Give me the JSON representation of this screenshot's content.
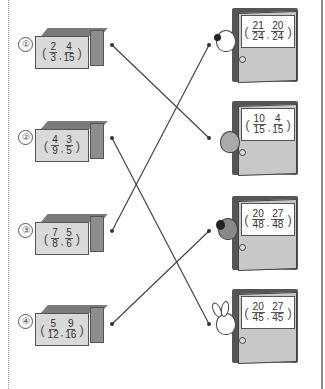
{
  "worksheet": {
    "boxes": [
      {
        "number": "①",
        "fractions": [
          {
            "n": "2",
            "d": "3"
          },
          {
            "n": "4",
            "d": "15"
          }
        ]
      },
      {
        "number": "②",
        "fractions": [
          {
            "n": "4",
            "d": "9"
          },
          {
            "n": "3",
            "d": "5"
          }
        ]
      },
      {
        "number": "③",
        "fractions": [
          {
            "n": "7",
            "d": "8"
          },
          {
            "n": "5",
            "d": "6"
          }
        ]
      },
      {
        "number": "④",
        "fractions": [
          {
            "n": "5",
            "d": "12"
          },
          {
            "n": "9",
            "d": "16"
          }
        ]
      }
    ],
    "doors": [
      {
        "animal": "dog",
        "fractions": [
          {
            "n": "21",
            "d": "24"
          },
          {
            "n": "20",
            "d": "24"
          }
        ]
      },
      {
        "animal": "cat",
        "fractions": [
          {
            "n": "10",
            "d": "15"
          },
          {
            "n": "4",
            "d": "15"
          }
        ]
      },
      {
        "animal": "black-dog",
        "fractions": [
          {
            "n": "20",
            "d": "48"
          },
          {
            "n": "27",
            "d": "48"
          }
        ]
      },
      {
        "animal": "rabbit",
        "fractions": [
          {
            "n": "20",
            "d": "45"
          },
          {
            "n": "27",
            "d": "45"
          }
        ]
      }
    ],
    "connections": [
      {
        "box": 1,
        "door": 2
      },
      {
        "box": 2,
        "door": 4
      },
      {
        "box": 3,
        "door": 1
      },
      {
        "box": 4,
        "door": 3
      }
    ],
    "separators": {
      "comma": ","
    },
    "parens": {
      "open": "(",
      "close": ")"
    }
  }
}
